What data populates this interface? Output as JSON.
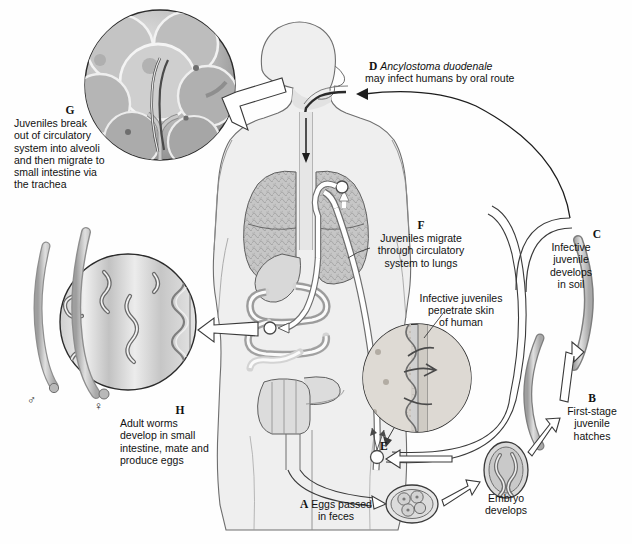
{
  "diagram": {
    "organism": "Ancylostoma duodenale",
    "background": "#fefefe",
    "ink": "#111111"
  },
  "stages": {
    "a": {
      "key": "A",
      "line1": "Eggs passed",
      "line2": "in feces"
    },
    "b": {
      "key": "B",
      "line1": "First-stage",
      "line2": "juvenile",
      "line3": "hatches"
    },
    "c": {
      "key": "C",
      "line1": "Infective",
      "line2": "juvenile",
      "line3": "develops",
      "line4": "in soil"
    },
    "d": {
      "key": "D",
      "species": "Ancylostoma duodenale",
      "line2": "may infect humans by oral route"
    },
    "e": {
      "key": "E"
    },
    "f": {
      "key": "F",
      "line1": "Juveniles migrate",
      "line2": "through circulatory",
      "line3": "system to lungs"
    },
    "g": {
      "key": "G",
      "line1": "Juveniles break",
      "line2": "out of circulatory",
      "line3": "system into alveoli",
      "line4": "and then migrate to",
      "line5": "small intestine via",
      "line6": "the trachea"
    },
    "h": {
      "key": "H",
      "line1": "Adult worms",
      "line2": "develop in small",
      "line3": "intestine, mate and",
      "line4": "produce eggs"
    }
  },
  "annotations": {
    "embryo": {
      "line1": "Embryo",
      "line2": "develops"
    },
    "skin": {
      "line1": "Infective juveniles",
      "line2": "penetrate skin",
      "line3": "of human"
    },
    "male_symbol": "♂",
    "female_symbol": "♀"
  },
  "colors": {
    "outline": "#3a3a3a",
    "body_fill": "#efefef",
    "organ_fill": "#d6d6d6",
    "lung_fill": "#c9c9c9",
    "worm_fill": "#bdbdbd",
    "inset_fill": "#c4c4c4",
    "arrow_fill": "#ffffff"
  }
}
